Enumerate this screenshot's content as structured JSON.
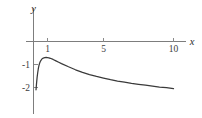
{
  "chart_data": {
    "type": "line",
    "title": "",
    "xlabel": "x",
    "ylabel": "y",
    "xlim": [
      -0.35,
      11.5
    ],
    "ylim": [
      -3.2,
      0.55
    ],
    "grid": false,
    "legend": null,
    "xticks": [
      1,
      5,
      10
    ],
    "xtick_labels": [
      "1",
      "5",
      "10"
    ],
    "yticks": [
      -1,
      -2
    ],
    "ytick_labels": [
      "-1",
      "-2"
    ],
    "series": [
      {
        "name": "curve",
        "color": "#3a3a3a",
        "x": [
          0.18,
          0.22,
          0.26,
          0.3,
          0.35,
          0.4,
          0.45,
          0.5,
          0.6,
          0.7,
          0.8,
          0.9,
          1.0,
          1.1,
          1.2,
          1.4,
          1.6,
          1.8,
          2.0,
          2.5,
          3.0,
          3.5,
          4.0,
          4.5,
          5.0,
          5.5,
          6.0,
          6.5,
          7.0,
          7.5,
          8.0,
          8.5,
          9.0,
          9.5,
          10.0
        ],
        "y": [
          -2.1,
          -1.8,
          -1.55,
          -1.36,
          -1.16,
          -1.02,
          -0.92,
          -0.85,
          -0.76,
          -0.72,
          -0.7,
          -0.695,
          -0.7,
          -0.71,
          -0.73,
          -0.78,
          -0.84,
          -0.9,
          -0.96,
          -1.1,
          -1.23,
          -1.34,
          -1.44,
          -1.52,
          -1.59,
          -1.66,
          -1.72,
          -1.77,
          -1.82,
          -1.86,
          -1.9,
          -1.94,
          -1.98,
          -2.01,
          -2.05
        ]
      }
    ],
    "axes": {
      "x_axis_label": "x",
      "y_axis_label": "y",
      "x_axis_at_y": 0,
      "y_axis_at_x": 0
    }
  },
  "labels": {
    "x_axis": "x",
    "y_axis": "y",
    "xtick_1": "1",
    "xtick_5": "5",
    "xtick_10": "10",
    "ytick_m1": "-1",
    "ytick_m2": "-2"
  },
  "colors": {
    "curve": "#3a3a3a",
    "axis": "#7d7d7d",
    "tick": "#8a8a8a",
    "text": "#3c3c3c",
    "background": "#ffffff"
  }
}
